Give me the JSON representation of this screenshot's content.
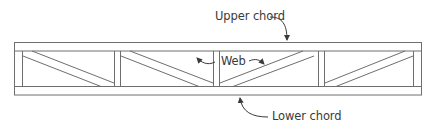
{
  "diagram": {
    "type": "truss",
    "colors": {
      "line": "#6e6e6e",
      "text": "#3a3a3a",
      "background": "#ffffff"
    },
    "labels": {
      "upper_chord": "Upper chord",
      "web": "Web",
      "lower_chord": "Lower chord"
    },
    "panels": 4,
    "components": [
      "upper-chord",
      "lower-chord",
      "vertical-posts",
      "diagonal-webs"
    ]
  }
}
